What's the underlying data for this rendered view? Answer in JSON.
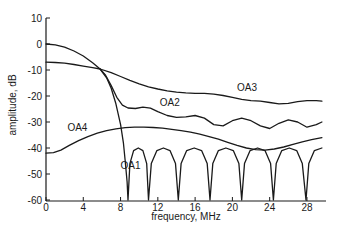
{
  "chart_data": {
    "type": "line",
    "title": "",
    "xlabel": "frequency, MHz",
    "ylabel": "amplitude, dB",
    "xlim": [
      0,
      30
    ],
    "ylim": [
      -60,
      10
    ],
    "x_ticks": [
      0,
      4,
      8,
      12,
      16,
      20,
      24,
      28
    ],
    "y_ticks": [
      10,
      0,
      -10,
      -20,
      -30,
      -40,
      -50,
      -60
    ],
    "grid": false,
    "legend": "inline labels",
    "series": [
      {
        "name": "OA1",
        "label_pos": [
          8.0,
          -48
        ],
        "points": [
          [
            0,
            0
          ],
          [
            1,
            -0.3
          ],
          [
            2,
            -1.2
          ],
          [
            3,
            -2.7
          ],
          [
            4,
            -4.6
          ],
          [
            5,
            -7.2
          ],
          [
            5.8,
            -9.6
          ],
          [
            6.5,
            -13
          ],
          [
            7,
            -17
          ],
          [
            7.5,
            -23
          ],
          [
            8,
            -31
          ],
          [
            8.3,
            -38
          ],
          [
            8.5,
            -45
          ],
          [
            8.7,
            -53
          ],
          [
            8.8,
            -60
          ],
          [
            8.8,
            -60
          ],
          [
            9.0,
            -46
          ],
          [
            9.4,
            -41
          ],
          [
            9.9,
            -40
          ],
          [
            10.4,
            -41
          ],
          [
            10.8,
            -46
          ],
          [
            11.0,
            -60
          ],
          [
            11.0,
            -60
          ],
          [
            11.3,
            -46
          ],
          [
            11.9,
            -41
          ],
          [
            12.6,
            -40
          ],
          [
            13.3,
            -41
          ],
          [
            13.9,
            -46
          ],
          [
            14.2,
            -60
          ],
          [
            14.2,
            -60
          ],
          [
            14.5,
            -46
          ],
          [
            15.1,
            -41
          ],
          [
            15.9,
            -40
          ],
          [
            16.7,
            -41
          ],
          [
            17.3,
            -46
          ],
          [
            17.6,
            -60
          ],
          [
            17.6,
            -60
          ],
          [
            17.9,
            -46
          ],
          [
            18.5,
            -41
          ],
          [
            19.3,
            -40
          ],
          [
            20.1,
            -41
          ],
          [
            20.7,
            -46
          ],
          [
            21.0,
            -60
          ],
          [
            21.0,
            -60
          ],
          [
            21.3,
            -46
          ],
          [
            21.9,
            -41
          ],
          [
            22.7,
            -40
          ],
          [
            23.5,
            -41
          ],
          [
            24.1,
            -46
          ],
          [
            24.4,
            -60
          ],
          [
            24.4,
            -60
          ],
          [
            24.7,
            -46
          ],
          [
            25.3,
            -41
          ],
          [
            26.1,
            -40
          ],
          [
            26.9,
            -41
          ],
          [
            27.5,
            -46
          ],
          [
            27.9,
            -60
          ],
          [
            27.9,
            -60
          ],
          [
            28.2,
            -46
          ],
          [
            28.8,
            -41
          ],
          [
            29.6,
            -40
          ]
        ]
      },
      {
        "name": "OA2",
        "label_pos": [
          12.2,
          -24
        ],
        "points": [
          [
            5.8,
            -9.6
          ],
          [
            6.4,
            -12
          ],
          [
            7,
            -16
          ],
          [
            7.6,
            -20.5
          ],
          [
            8.2,
            -23.5
          ],
          [
            8.8,
            -24.6
          ],
          [
            9.6,
            -24.8
          ],
          [
            10.4,
            -24.3
          ],
          [
            11.2,
            -24.7
          ],
          [
            12,
            -26
          ],
          [
            13,
            -27.5
          ],
          [
            14,
            -28.2
          ],
          [
            15,
            -28
          ],
          [
            16,
            -27.5
          ],
          [
            17,
            -28.5
          ],
          [
            18,
            -31
          ],
          [
            19,
            -31.5
          ],
          [
            20,
            -29.5
          ],
          [
            21,
            -28.5
          ],
          [
            22,
            -29.5
          ],
          [
            23,
            -31.5
          ],
          [
            24,
            -32.5
          ],
          [
            25,
            -30.5
          ],
          [
            26,
            -29.2
          ],
          [
            27,
            -30
          ],
          [
            28,
            -32
          ],
          [
            29,
            -31
          ],
          [
            29.6,
            -30
          ]
        ]
      },
      {
        "name": "OA3",
        "label_pos": [
          20.5,
          -18
        ],
        "points": [
          [
            0,
            -7
          ],
          [
            1,
            -7.1
          ],
          [
            2,
            -7.4
          ],
          [
            3,
            -7.9
          ],
          [
            4,
            -8.5
          ],
          [
            5,
            -9.1
          ],
          [
            5.8,
            -9.6
          ],
          [
            7,
            -11
          ],
          [
            8,
            -12.5
          ],
          [
            9,
            -14
          ],
          [
            10,
            -15.3
          ],
          [
            11,
            -16.5
          ],
          [
            12,
            -17.3
          ],
          [
            13,
            -18
          ],
          [
            14,
            -18.5
          ],
          [
            15,
            -18.8
          ],
          [
            16,
            -19
          ],
          [
            17,
            -19
          ],
          [
            18,
            -19.3
          ],
          [
            19,
            -19.8
          ],
          [
            20,
            -20.5
          ],
          [
            21,
            -21.3
          ],
          [
            22,
            -21.8
          ],
          [
            23,
            -22
          ],
          [
            24,
            -22.5
          ],
          [
            25,
            -23
          ],
          [
            26,
            -22.8
          ],
          [
            27,
            -22.2
          ],
          [
            28,
            -21.8
          ],
          [
            29,
            -21.8
          ],
          [
            29.6,
            -22
          ]
        ]
      },
      {
        "name": "OA4",
        "label_pos": [
          2.3,
          -33.5
        ],
        "points": [
          [
            0,
            -42
          ],
          [
            0.8,
            -41.8
          ],
          [
            1.6,
            -40.8
          ],
          [
            2.5,
            -39
          ],
          [
            3.5,
            -37.2
          ],
          [
            4.5,
            -35.6
          ],
          [
            5.5,
            -34.3
          ],
          [
            6.5,
            -33.3
          ],
          [
            7.5,
            -32.6
          ],
          [
            8.5,
            -32.2
          ],
          [
            9.5,
            -32
          ],
          [
            10.5,
            -32
          ],
          [
            11.5,
            -32.1
          ],
          [
            12.5,
            -32.4
          ],
          [
            13.5,
            -32.8
          ],
          [
            14.5,
            -33.3
          ],
          [
            15.5,
            -33.9
          ],
          [
            16.5,
            -34.7
          ],
          [
            17.5,
            -35.6
          ],
          [
            18.5,
            -36.6
          ],
          [
            19.5,
            -37.8
          ],
          [
            20.5,
            -39
          ],
          [
            21.5,
            -40
          ],
          [
            22.5,
            -40.6
          ],
          [
            23.5,
            -40.8
          ],
          [
            24.5,
            -40.4
          ],
          [
            25.5,
            -39.6
          ],
          [
            26.5,
            -38.6
          ],
          [
            27.5,
            -37.6
          ],
          [
            28.5,
            -36.8
          ],
          [
            29.6,
            -36
          ]
        ]
      }
    ]
  },
  "axes": {
    "x_tick_labels": [
      "0",
      "4",
      "8",
      "12",
      "16",
      "20",
      "24",
      "28"
    ],
    "y_tick_labels": [
      "10",
      "0",
      "-10",
      "-20",
      "-30",
      "-40",
      "-50",
      "-60"
    ],
    "xlabel": "frequency, MHz",
    "ylabel": "amplitude, dB"
  }
}
